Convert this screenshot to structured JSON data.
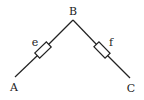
{
  "diagram": {
    "type": "circuit",
    "stroke_color": "#222222",
    "background": "#ffffff",
    "nodes": [
      {
        "id": "A",
        "label": "A",
        "x": 15,
        "y": 77,
        "label_x": 14,
        "label_y": 91
      },
      {
        "id": "B",
        "label": "B",
        "x": 73,
        "y": 20,
        "label_x": 73,
        "label_y": 15
      },
      {
        "id": "C",
        "label": "C",
        "x": 130,
        "y": 78,
        "label_x": 131,
        "label_y": 92
      }
    ],
    "components": [
      {
        "id": "e",
        "type": "resistor",
        "label": "e",
        "from": "A",
        "to": "B",
        "cx": 43,
        "cy": 50,
        "label_x": 35,
        "label_y": 46
      },
      {
        "id": "f",
        "type": "resistor",
        "label": "f",
        "from": "B",
        "to": "C",
        "cx": 102,
        "cy": 50,
        "label_x": 111,
        "label_y": 46
      }
    ]
  }
}
